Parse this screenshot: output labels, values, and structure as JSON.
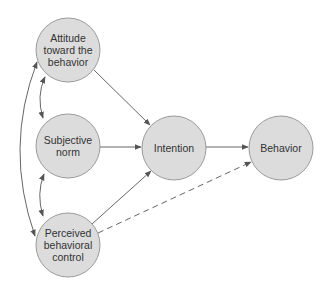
{
  "diagram": {
    "nodes": [
      {
        "id": "attitude",
        "label": "Attitude toward the behavior",
        "lines": [
          "Attitude",
          "toward the",
          "behavior"
        ],
        "cx": 68,
        "cy": 50,
        "r": 32
      },
      {
        "id": "subjective_norm",
        "label": "Subjective norm",
        "lines": [
          "Subjective",
          "norm"
        ],
        "cx": 68,
        "cy": 146,
        "r": 32
      },
      {
        "id": "pbc",
        "label": "Perceived behavioral control",
        "lines": [
          "Perceived",
          "behavioral",
          "control"
        ],
        "cx": 68,
        "cy": 245,
        "r": 32
      },
      {
        "id": "intention",
        "label": "Intention",
        "lines": [
          "Intention"
        ],
        "cx": 174,
        "cy": 148,
        "r": 32
      },
      {
        "id": "behavior",
        "label": "Behavior",
        "lines": [
          "Behavior"
        ],
        "cx": 281,
        "cy": 148,
        "r": 32
      }
    ],
    "edges": [
      {
        "from": "attitude",
        "to": "intention",
        "style": "solid",
        "direction": "forward"
      },
      {
        "from": "subjective_norm",
        "to": "intention",
        "style": "solid",
        "direction": "forward"
      },
      {
        "from": "pbc",
        "to": "intention",
        "style": "solid",
        "direction": "forward"
      },
      {
        "from": "intention",
        "to": "behavior",
        "style": "solid",
        "direction": "forward"
      },
      {
        "from": "pbc",
        "to": "behavior",
        "style": "dashed",
        "direction": "forward"
      },
      {
        "from": "attitude",
        "to": "subjective_norm",
        "style": "solid",
        "direction": "bidirectional"
      },
      {
        "from": "subjective_norm",
        "to": "pbc",
        "style": "solid",
        "direction": "bidirectional"
      },
      {
        "from": "attitude",
        "to": "pbc",
        "style": "solid",
        "direction": "bidirectional"
      }
    ],
    "colors": {
      "node_fill": "#dcdcdc",
      "node_stroke": "#9a9a9a",
      "edge": "#555555",
      "text": "#333333"
    }
  },
  "labels": {
    "attitude_1": "Attitude",
    "attitude_2": "toward the",
    "attitude_3": "behavior",
    "norm_1": "Subjective",
    "norm_2": "norm",
    "pbc_1": "Perceived",
    "pbc_2": "behavioral",
    "pbc_3": "control",
    "intention": "Intention",
    "behavior": "Behavior"
  }
}
